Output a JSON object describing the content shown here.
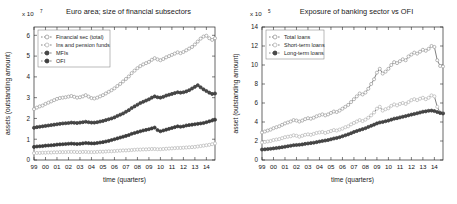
{
  "figure": {
    "background": "#ffffff",
    "marker_fill_open": "#b9b9b9",
    "marker_fill_solid": "#4a4a4a",
    "line_color": "#555555"
  },
  "chart_data": [
    {
      "type": "line",
      "title": "Euro area; size of financial subsectors",
      "xlabel": "time (quarters)",
      "ylabel": "assets (outstanding amount)",
      "y_exponent_label": "x 10",
      "y_exponent_value": "7",
      "xlim": [
        0,
        63
      ],
      "ylim": [
        0,
        6.4
      ],
      "yticks": [
        0,
        1,
        2,
        3,
        4,
        5,
        6
      ],
      "ytick_labels": [
        "0",
        "1",
        "2",
        "3",
        "4",
        "5",
        "6"
      ],
      "xtick_labels": [
        "99",
        "00",
        "01",
        "02",
        "03",
        "04",
        "05",
        "06",
        "07",
        "08",
        "09",
        "10",
        "11",
        "12",
        "13",
        "14"
      ],
      "grid": false,
      "legend_position": "upper-left",
      "series": [
        {
          "name": "Financial sec (total)",
          "marker": "open-circle",
          "color": "#9a9a9a",
          "values": [
            2.45,
            2.52,
            2.58,
            2.62,
            2.7,
            2.76,
            2.82,
            2.88,
            2.94,
            2.98,
            3.0,
            3.02,
            3.05,
            3.08,
            3.04,
            3.0,
            3.02,
            3.06,
            3.12,
            3.05,
            2.98,
            2.96,
            3.0,
            3.06,
            3.12,
            3.2,
            3.28,
            3.36,
            3.45,
            3.56,
            3.66,
            3.78,
            3.9,
            4.02,
            4.18,
            4.3,
            4.42,
            4.52,
            4.6,
            4.66,
            4.72,
            4.82,
            4.9,
            4.84,
            4.8,
            4.86,
            4.94,
            5.0,
            5.06,
            5.12,
            5.18,
            5.14,
            5.2,
            5.28,
            5.36,
            5.44,
            5.56,
            5.7,
            5.84,
            5.94,
            5.98,
            5.86,
            5.78,
            5.86
          ]
        },
        {
          "name": "Ins and pension funds",
          "marker": "open-circle",
          "color": "#b5b5b5",
          "values": [
            0.33,
            0.34,
            0.34,
            0.35,
            0.35,
            0.36,
            0.36,
            0.37,
            0.37,
            0.38,
            0.38,
            0.38,
            0.39,
            0.39,
            0.39,
            0.38,
            0.38,
            0.39,
            0.39,
            0.38,
            0.38,
            0.38,
            0.39,
            0.4,
            0.4,
            0.41,
            0.42,
            0.42,
            0.43,
            0.44,
            0.45,
            0.46,
            0.46,
            0.47,
            0.48,
            0.49,
            0.5,
            0.5,
            0.51,
            0.51,
            0.52,
            0.53,
            0.53,
            0.52,
            0.52,
            0.53,
            0.54,
            0.55,
            0.56,
            0.57,
            0.58,
            0.58,
            0.59,
            0.6,
            0.61,
            0.62,
            0.63,
            0.65,
            0.67,
            0.69,
            0.71,
            0.73,
            0.76,
            0.8
          ]
        },
        {
          "name": "MFIs",
          "marker": "solid-circle",
          "color": "#4a4a4a",
          "values": [
            1.55,
            1.58,
            1.6,
            1.62,
            1.64,
            1.66,
            1.68,
            1.7,
            1.72,
            1.74,
            1.76,
            1.77,
            1.78,
            1.8,
            1.79,
            1.78,
            1.8,
            1.82,
            1.84,
            1.82,
            1.8,
            1.8,
            1.82,
            1.85,
            1.88,
            1.92,
            1.96,
            2.0,
            2.05,
            2.12,
            2.18,
            2.24,
            2.32,
            2.4,
            2.5,
            2.58,
            2.66,
            2.74,
            2.8,
            2.86,
            2.92,
            3.0,
            3.06,
            3.02,
            3.0,
            3.04,
            3.1,
            3.14,
            3.18,
            3.22,
            3.26,
            3.24,
            3.26,
            3.3,
            3.36,
            3.44,
            3.52,
            3.6,
            3.5,
            3.4,
            3.32,
            3.24,
            3.18,
            3.2
          ]
        },
        {
          "name": "OFI",
          "marker": "solid-circle",
          "color": "#3f3f3f",
          "values": [
            0.63,
            0.65,
            0.66,
            0.67,
            0.69,
            0.7,
            0.71,
            0.72,
            0.74,
            0.75,
            0.76,
            0.77,
            0.78,
            0.79,
            0.78,
            0.77,
            0.78,
            0.8,
            0.82,
            0.81,
            0.8,
            0.8,
            0.82,
            0.84,
            0.86,
            0.89,
            0.92,
            0.96,
            1.0,
            1.04,
            1.08,
            1.12,
            1.16,
            1.2,
            1.26,
            1.3,
            1.34,
            1.38,
            1.42,
            1.45,
            1.48,
            1.52,
            1.56,
            1.44,
            1.38,
            1.42,
            1.46,
            1.5,
            1.54,
            1.58,
            1.62,
            1.6,
            1.62,
            1.66,
            1.68,
            1.7,
            1.72,
            1.74,
            1.76,
            1.78,
            1.82,
            1.86,
            1.9,
            1.94
          ]
        }
      ]
    },
    {
      "type": "line",
      "title": "Exposure of banking sector vs OFI",
      "xlabel": "time (quarters)",
      "ylabel": "asset (outstanding amount)",
      "y_exponent_label": "x 10",
      "y_exponent_value": "5",
      "xlim": [
        0,
        63
      ],
      "ylim": [
        0,
        14
      ],
      "yticks": [
        0,
        2,
        4,
        6,
        8,
        10,
        12,
        14
      ],
      "ytick_labels": [
        "0",
        "2",
        "4",
        "6",
        "8",
        "10",
        "12",
        "14"
      ],
      "xtick_labels": [
        "99",
        "00",
        "01",
        "02",
        "03",
        "04",
        "05",
        "06",
        "07",
        "08",
        "09",
        "10",
        "11",
        "12",
        "13",
        "14"
      ],
      "grid": false,
      "legend_position": "upper-left",
      "series": [
        {
          "name": "Total loans",
          "marker": "open-circle",
          "color": "#9a9a9a",
          "values": [
            2.9,
            3.0,
            3.1,
            3.2,
            3.35,
            3.45,
            3.55,
            3.7,
            3.85,
            3.95,
            4.05,
            4.2,
            4.15,
            4.05,
            4.15,
            4.3,
            4.4,
            4.35,
            4.45,
            4.6,
            4.7,
            4.8,
            4.7,
            4.8,
            4.95,
            5.1,
            5.05,
            5.2,
            5.4,
            5.6,
            5.8,
            6.1,
            6.4,
            6.7,
            7.0,
            6.9,
            7.1,
            7.5,
            8.0,
            8.5,
            9.2,
            9.6,
            9.1,
            9.3,
            9.6,
            10.0,
            10.3,
            10.2,
            10.4,
            10.6,
            10.5,
            10.9,
            11.1,
            11.3,
            11.2,
            11.4,
            11.6,
            11.5,
            11.7,
            12.0,
            11.9,
            10.5,
            9.9,
            9.85
          ]
        },
        {
          "name": "Short-term loans",
          "marker": "open-circle",
          "color": "#b5b5b5",
          "values": [
            1.85,
            1.9,
            1.95,
            2.0,
            2.1,
            2.15,
            2.2,
            2.3,
            2.4,
            2.45,
            2.5,
            2.6,
            2.55,
            2.45,
            2.55,
            2.65,
            2.7,
            2.65,
            2.75,
            2.85,
            2.9,
            2.95,
            2.85,
            2.95,
            3.05,
            3.15,
            3.1,
            3.2,
            3.3,
            3.45,
            3.55,
            3.75,
            3.9,
            4.05,
            4.2,
            4.1,
            4.25,
            4.45,
            4.7,
            5.0,
            5.4,
            5.6,
            5.2,
            5.35,
            5.45,
            5.7,
            5.85,
            5.75,
            5.9,
            6.0,
            5.9,
            6.1,
            6.3,
            6.4,
            6.3,
            6.45,
            6.55,
            6.4,
            6.55,
            6.8,
            6.7,
            5.6,
            5.0,
            4.95
          ]
        },
        {
          "name": "Long-term loans",
          "marker": "solid-circle",
          "color": "#4a4a4a",
          "values": [
            1.1,
            1.12,
            1.15,
            1.18,
            1.22,
            1.26,
            1.3,
            1.35,
            1.4,
            1.45,
            1.5,
            1.56,
            1.58,
            1.6,
            1.64,
            1.7,
            1.74,
            1.78,
            1.82,
            1.88,
            1.94,
            2.0,
            2.05,
            2.1,
            2.18,
            2.26,
            2.32,
            2.4,
            2.5,
            2.6,
            2.7,
            2.82,
            2.95,
            3.05,
            3.15,
            3.25,
            3.35,
            3.48,
            3.6,
            3.72,
            3.85,
            3.95,
            4.0,
            4.08,
            4.15,
            4.25,
            4.35,
            4.4,
            4.48,
            4.55,
            4.62,
            4.7,
            4.78,
            4.85,
            4.92,
            5.0,
            5.08,
            5.12,
            5.18,
            5.2,
            5.15,
            5.05,
            4.95,
            4.9
          ]
        }
      ]
    }
  ]
}
